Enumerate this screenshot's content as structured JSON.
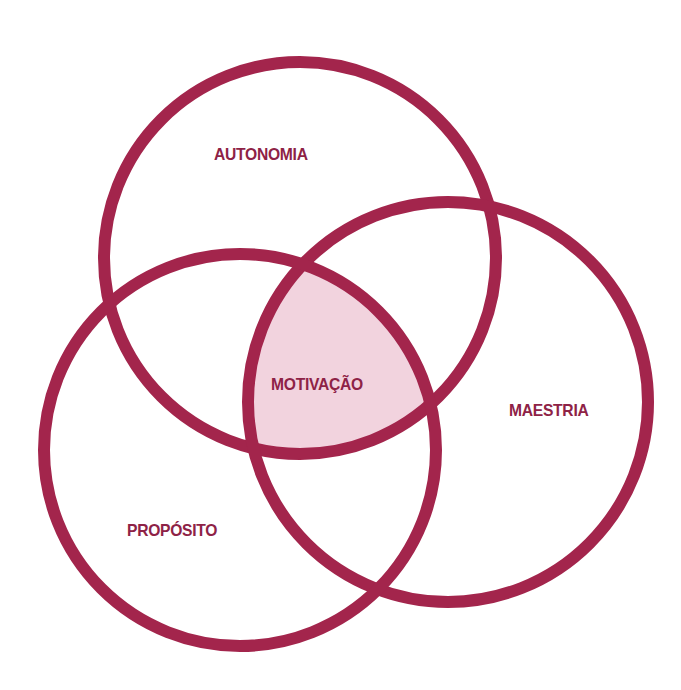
{
  "diagram": {
    "type": "venn",
    "colors": {
      "stroke": "#A3254C",
      "text": "#8E2246",
      "intersection_fill": "#F2D3DE",
      "background": "#FFFFFF"
    },
    "circles": [
      {
        "id": "autonomia",
        "label": "AUTONOMIA",
        "cx": 300,
        "cy": 258,
        "r": 196,
        "label_x": 214,
        "label_y": 145
      },
      {
        "id": "maestria",
        "label": "MAESTRIA",
        "cx": 448,
        "cy": 402,
        "r": 200,
        "label_x": 509,
        "label_y": 401
      },
      {
        "id": "proposito",
        "label": "PROPÓSITO",
        "cx": 240,
        "cy": 450,
        "r": 196,
        "label_x": 127,
        "label_y": 521
      }
    ],
    "center": {
      "label": "MOTIVAÇÃO",
      "label_x": 271,
      "label_y": 375
    }
  }
}
